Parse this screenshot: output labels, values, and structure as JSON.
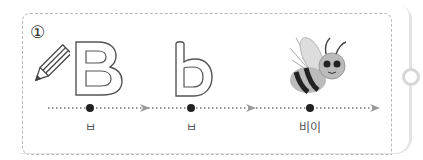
{
  "exercise": {
    "number": "①",
    "items": [
      {
        "glyph": "B",
        "label": "ㅂ"
      },
      {
        "glyph": "b",
        "label": "ㅂ"
      },
      {
        "picture": "bee",
        "label": "비이"
      }
    ]
  },
  "icons": {
    "pencil": "pencil-icon",
    "bee": "bee-illustration"
  },
  "colors": {
    "outline": "#555555",
    "dash": "#b8b8b8",
    "dot": "#222222",
    "arrow": "#999999"
  }
}
